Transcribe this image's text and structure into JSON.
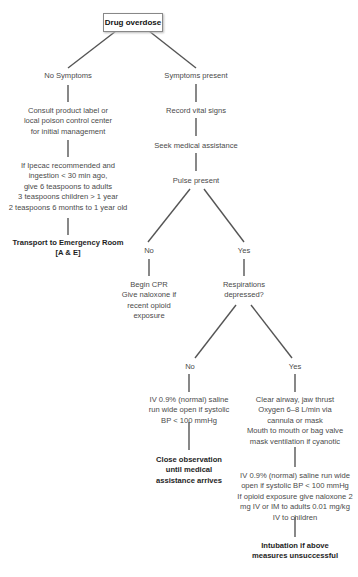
{
  "root": {
    "label": "Drug overdose"
  },
  "left_branch": {
    "label": "No Symptoms",
    "step1": [
      "Consult product label or",
      "local poison control center",
      "for initial management"
    ],
    "step2": [
      "If Ipecac recommended and",
      "ingestion < 30 min ago,",
      "give 6 teaspoons to adults",
      "3 teaspoons children > 1 year",
      "2 teaspoons 6 months to 1 year old"
    ],
    "final": [
      "Transport to Emergency Room",
      "[A & E]"
    ]
  },
  "right_branch": {
    "label": "Symptoms present",
    "step1": "Record vital signs",
    "step2": "Seek medical assistance",
    "decision": "Pulse present",
    "pulse_no": {
      "label": "No",
      "action": [
        "Begin CPR",
        "Give naloxone if",
        "recent opioid",
        "exposure"
      ]
    },
    "pulse_yes": {
      "label": "Yes",
      "decision": [
        "Respirations",
        "depressed?"
      ],
      "resp_no": {
        "label": "No",
        "action": [
          "IV 0.9% (normal) saline",
          "run wide open if systolic",
          "BP < 100 mmHg"
        ],
        "final": [
          "Close observation",
          "until medical",
          "assistance arrives"
        ]
      },
      "resp_yes": {
        "label": "Yes",
        "action1": [
          "Clear airway, jaw thrust",
          "Oxygen 6–8 L/min via",
          "cannula or mask",
          "Mouth to mouth or bag valve",
          "mask ventilation if cyanotic"
        ],
        "action2": [
          "IV 0.9% (normal) saline run wide",
          "open if systolic BP < 100 mmHg",
          "If opioid exposure give naloxone 2",
          "mg IV or IM to adults 0.01 mg/kg",
          "IV to children"
        ],
        "final": [
          "Intubation if above",
          "measures unsuccessful"
        ]
      }
    }
  },
  "colors": {
    "line": "#555555",
    "text": "#4a4a4a",
    "bold_text": "#1e1e1e",
    "box_border": "#888888"
  }
}
